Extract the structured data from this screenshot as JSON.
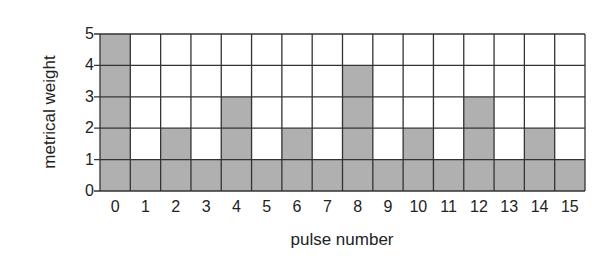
{
  "chart_data": {
    "type": "bar",
    "title": "",
    "xlabel": "pulse number",
    "ylabel": "metrical weight",
    "categories": [
      "0",
      "1",
      "2",
      "3",
      "4",
      "5",
      "6",
      "7",
      "8",
      "9",
      "10",
      "11",
      "12",
      "13",
      "14",
      "15"
    ],
    "values": [
      5,
      1,
      2,
      1,
      3,
      1,
      2,
      1,
      4,
      1,
      2,
      1,
      3,
      1,
      2,
      1
    ],
    "ylim": [
      0,
      5
    ],
    "yticks": [
      "0",
      "1",
      "2",
      "3",
      "4",
      "5"
    ],
    "grid": true,
    "legend": null,
    "colors": {
      "filled": "#b0b0b0",
      "empty": "#ffffff",
      "grid": "#333333"
    }
  }
}
